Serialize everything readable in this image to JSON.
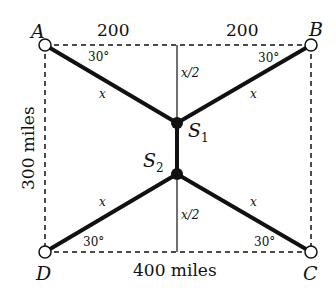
{
  "diagram": {
    "corners": {
      "A": "A",
      "B": "B",
      "C": "C",
      "D": "D"
    },
    "dimensions": {
      "top_left": "200",
      "top_right": "200",
      "bottom": "400 miles",
      "left": "300 miles"
    },
    "angles": {
      "A": "30°",
      "B": "30°",
      "C": "30°",
      "D": "30°"
    },
    "segments": {
      "AS1": "x",
      "BS1": "x",
      "CS2": "x",
      "DS2": "x",
      "upper_half": "x/2",
      "lower_half": "x/2"
    },
    "stations": {
      "S1": {
        "letter": "S",
        "sub": "1"
      },
      "S2": {
        "letter": "S",
        "sub": "2"
      }
    },
    "colors": {
      "line": "#111111",
      "background": "#ffffff"
    }
  }
}
